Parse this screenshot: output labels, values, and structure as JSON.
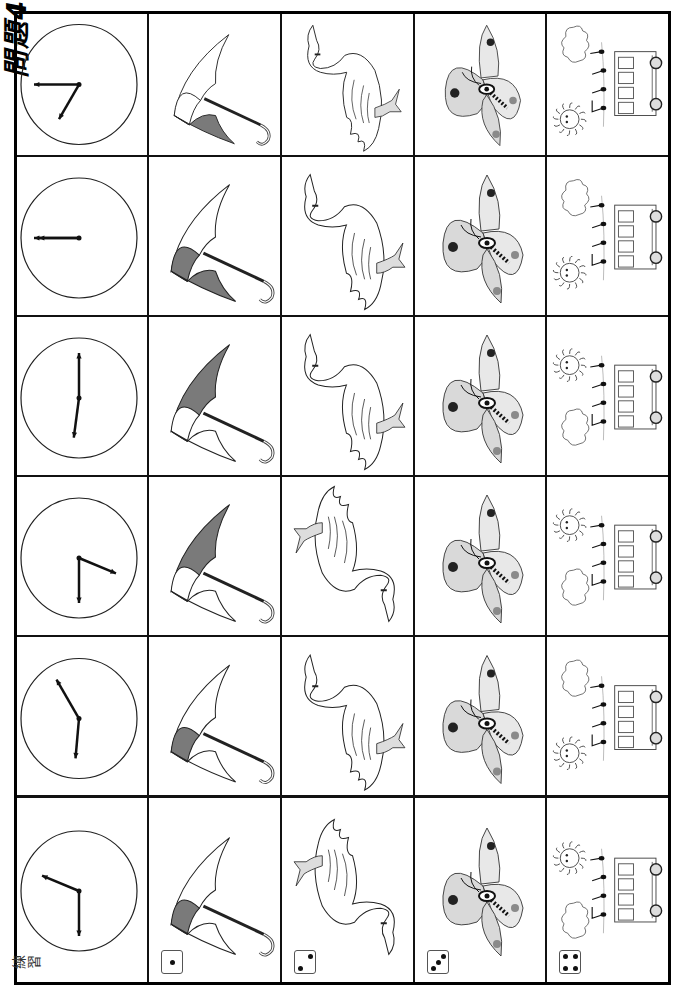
{
  "worksheet": {
    "title": "問題4",
    "practice_label": "練習",
    "orientation": "rotated-90-ccw",
    "columns": [
      {
        "key": "clock",
        "label": "clock-icon"
      },
      {
        "key": "umbrella",
        "label": "umbrella-icon"
      },
      {
        "key": "swan",
        "label": "swan-icon"
      },
      {
        "key": "butterfly",
        "label": "butterfly-icon"
      },
      {
        "key": "scene",
        "label": "sun-notes-bus-scene-icon"
      }
    ],
    "rows": [
      {
        "index": 1,
        "clock_time": "10:00",
        "umbrella_shaded": "bottom",
        "swan": "upright-head-up",
        "butterfly": "variant-a",
        "scene": "cloud-top-sun-bottom"
      },
      {
        "index": 2,
        "clock_time": "12:00",
        "umbrella_shaded": "bottom-left",
        "swan": "upright-head-up",
        "butterfly": "variant-b",
        "scene": "cloud-top-sun-bottom"
      },
      {
        "index": 3,
        "clock_time": "9:15",
        "umbrella_shaded": "top",
        "swan": "upright-head-up",
        "butterfly": "variant-c",
        "scene": "sun-top-cloud-bottom"
      },
      {
        "index": 4,
        "clock_time": "6:45",
        "umbrella_shaded": "top",
        "swan": "inverted-head-down",
        "butterfly": "variant-d",
        "scene": "sun-top-cloud-bottom"
      },
      {
        "index": 5,
        "clock_time": "9:10",
        "umbrella_shaded": "left",
        "swan": "upright-head-up",
        "butterfly": "variant-e",
        "scene": "cloud-top-sun-bottom"
      },
      {
        "index": 6,
        "practice": true,
        "clock_time": "12:45",
        "umbrella_shaded": "left",
        "swan": "inverted-head-down",
        "butterfly": "variant-f",
        "scene": "sun-top-cloud-bottom"
      }
    ],
    "dice": [
      {
        "column": "umbrella",
        "value": 1
      },
      {
        "column": "swan",
        "value": 2
      },
      {
        "column": "butterfly",
        "value": 3
      },
      {
        "column": "scene",
        "value": 4
      }
    ],
    "colors": {
      "line": "#111111",
      "umbrella_shade": "#7a7a7a",
      "butterfly_wing": "#d9d9d9",
      "butterfly_spot_dark": "#222222",
      "butterfly_spot_light": "#8a8a8a"
    }
  }
}
